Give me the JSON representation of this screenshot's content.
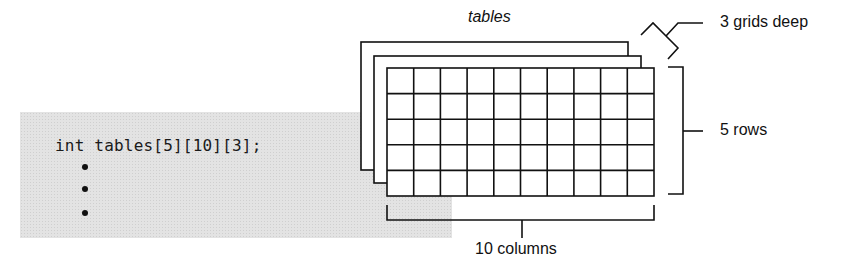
{
  "code": {
    "declaration": "int tables[5][10][3];",
    "continuation_bullets": 3
  },
  "diagram": {
    "array_name_label": "tables",
    "depth_label": "3 grids deep",
    "rows_label": "5 rows",
    "columns_label": "10 columns",
    "rows": 5,
    "columns": 10,
    "depth": 3
  },
  "colors": {
    "ink": "#111111",
    "panel": "#e3e3e3",
    "sheet": "#ffffff"
  }
}
